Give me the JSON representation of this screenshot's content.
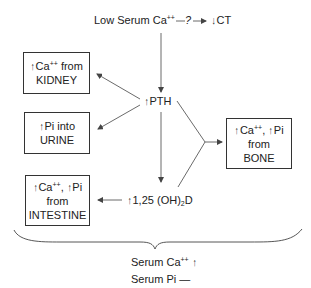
{
  "top": {
    "trigger_prefix": "Low Serum Ca",
    "trigger_sup": "++",
    "question": "?",
    "ct_arrow": "↓",
    "ct_label": "CT"
  },
  "pth": {
    "arrow": "↑",
    "label": "PTH"
  },
  "vitd": {
    "arrow": "↑",
    "label_prefix": "1,25 (OH)",
    "label_sub": "2",
    "label_suffix": "D"
  },
  "boxes": {
    "kidney": {
      "line1_arrow": "↑",
      "line1_text": "Ca",
      "line1_sup": "++",
      "line1_suffix": " from",
      "line2": "KIDNEY"
    },
    "urine": {
      "line1_arrow": "↑",
      "line1_text": "Pi into",
      "line2": "URINE"
    },
    "intestine": {
      "line1_arrow1": "↑",
      "line1_text1": "Ca",
      "line1_sup": "++",
      "line1_sep": ", ",
      "line1_arrow2": "↑",
      "line1_text2": "Pi",
      "line2": "from",
      "line3": "INTESTINE"
    },
    "bone": {
      "line1_arrow1": "↑",
      "line1_text1": "Ca",
      "line1_sup": "++",
      "line1_sep": ", ",
      "line1_arrow2": "↑",
      "line1_text2": "Pi",
      "line2": "from",
      "line3": "BONE"
    }
  },
  "result": {
    "ca_label": "Serum Ca",
    "ca_sup": "++",
    "ca_indicator": "↑",
    "pi_label": "Serum Pi",
    "pi_indicator": "—"
  },
  "colors": {
    "line": "#444444",
    "text": "#222222",
    "background": "#ffffff"
  }
}
